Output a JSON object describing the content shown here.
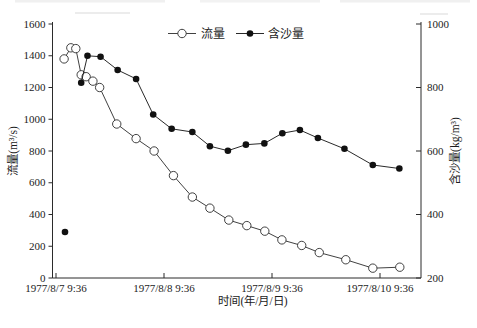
{
  "page": {
    "background": "#ffffff"
  },
  "chart_data": {
    "type": "line",
    "title": "",
    "xlabel": "时间(年/月/日)",
    "ylabel_left": "流量(m³/s)",
    "ylabel_right": "含沙量(kg/m³)",
    "x_tick_labels": [
      "1977/8/7 9:36",
      "1977/8/8 9:36",
      "1977/8/9 9:36",
      "1977/8/10 9:36"
    ],
    "x_tick_hours": [
      0,
      24,
      48,
      72
    ],
    "axes": {
      "left": {
        "label": "流量(m³/s)",
        "min": 0,
        "max": 1600,
        "step": 200,
        "tick_labels": [
          "0",
          "200",
          "400",
          "600",
          "800",
          "1000",
          "1200",
          "1400",
          "1600"
        ]
      },
      "right": {
        "label": "含沙量(kg/m³)",
        "min": 200,
        "max": 1000,
        "step": 200,
        "tick_labels": [
          "200",
          "400",
          "600",
          "800",
          "1000"
        ]
      }
    },
    "grid": false,
    "legend": {
      "position": "top-center",
      "items": [
        {
          "label": "流量",
          "marker": "open-circle"
        },
        {
          "label": "含沙量",
          "marker": "filled-circle"
        }
      ]
    },
    "series": [
      {
        "name": "流量",
        "yaxis": "left",
        "marker": "open-circle",
        "color": "#2b2b2b",
        "x_hours": [
          1.8,
          3.3,
          4.4,
          5.6,
          6.7,
          8.2,
          9.7,
          13.5,
          17.8,
          21.8,
          26.1,
          30.3,
          34.2,
          38.4,
          42.4,
          46.4,
          50.2,
          54.6,
          58.5,
          64.4,
          70.4,
          76.4
        ],
        "values": [
          1380,
          1450,
          1445,
          1280,
          1268,
          1240,
          1200,
          970,
          878,
          800,
          645,
          510,
          440,
          365,
          330,
          295,
          240,
          205,
          160,
          115,
          62,
          68
        ]
      },
      {
        "name": "含沙量",
        "yaxis": "right",
        "marker": "filled-circle",
        "color": "#111111",
        "first_point_isolated": true,
        "x_hours": [
          2.0,
          5.6,
          7.0,
          9.9,
          13.7,
          17.8,
          21.6,
          25.7,
          30.3,
          34.2,
          38.2,
          42.2,
          46.3,
          50.3,
          54.2,
          58.2,
          64.1,
          70.4,
          76.3
        ],
        "values": [
          345,
          815,
          900,
          897,
          855,
          827,
          715,
          670,
          660,
          615,
          601,
          620,
          624,
          656,
          666,
          641,
          607,
          556,
          545
        ]
      }
    ]
  }
}
